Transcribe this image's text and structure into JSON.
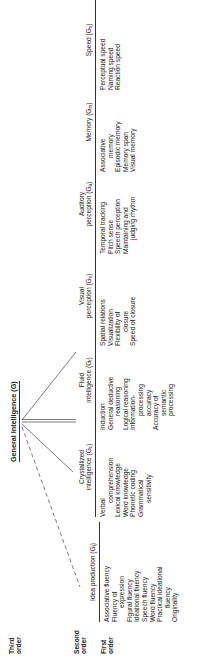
{
  "diagram": {
    "title": "General Intelligence (G)",
    "row_labels": {
      "third": [
        "Third",
        "order"
      ],
      "second": [
        "Second",
        "order"
      ],
      "first": [
        "First",
        "order"
      ]
    },
    "factors": [
      {
        "id": "idea-production",
        "head": [
          "",
          "Idea production (G"
        ],
        "sub": "i",
        "link": "dashed",
        "items": [
          {
            "text": "Associative fluency",
            "indent": false
          },
          {
            "text": "Fluency of",
            "indent": false
          },
          {
            "text": "expression",
            "indent": true
          },
          {
            "text": "Figural fluency",
            "indent": false
          },
          {
            "text": "Ideational fluency",
            "indent": false
          },
          {
            "text": "Speech fluency",
            "indent": false
          },
          {
            "text": "Word fluency",
            "indent": false
          },
          {
            "text": "Practical ideational",
            "indent": false
          },
          {
            "text": "fluency",
            "indent": true
          },
          {
            "text": "Originality",
            "indent": false
          }
        ]
      },
      {
        "id": "crystallized-intelligence",
        "head": [
          "Crystallized",
          "intelligence (G"
        ],
        "sub": "c",
        "link": "solid",
        "items": [
          {
            "text": "Verbal",
            "indent": false
          },
          {
            "text": "comprehension",
            "indent": true
          },
          {
            "text": "Lexical knowledge",
            "indent": false
          },
          {
            "text": "Word knowledge",
            "indent": false
          },
          {
            "text": "Phonetic coding",
            "indent": false
          },
          {
            "text": "Grammatical",
            "indent": false
          },
          {
            "text": "sensitivity",
            "indent": true
          }
        ]
      },
      {
        "id": "fluid-intelligence",
        "head": [
          "Fluid",
          "intelligence (G"
        ],
        "sub": "f",
        "link": "double",
        "items": [
          {
            "text": "Induction",
            "indent": false
          },
          {
            "text": "General deductive",
            "indent": false
          },
          {
            "text": "reasoning",
            "indent": true
          },
          {
            "text": "Logical reasoning",
            "indent": false
          },
          {
            "text": "Information-",
            "indent": false
          },
          {
            "text": "processing",
            "indent": true
          },
          {
            "text": "accuracy",
            "indent": true
          },
          {
            "text": "Accuracy of",
            "indent": false
          },
          {
            "text": "semantic",
            "indent": true
          },
          {
            "text": "processing",
            "indent": true
          }
        ]
      },
      {
        "id": "visual-perception",
        "head": [
          "Visual",
          "perception (G"
        ],
        "sub": "v",
        "link": "solid",
        "items": [
          {
            "text": "Spatial relations",
            "indent": false
          },
          {
            "text": "Visualization",
            "indent": false
          },
          {
            "text": "Flexibility of",
            "indent": false
          },
          {
            "text": "closure",
            "indent": true
          },
          {
            "text": "Speed of closure",
            "indent": false
          }
        ]
      },
      {
        "id": "auditory-perception",
        "head": [
          "Auditory",
          "perception (G"
        ],
        "sub": "a",
        "link": "none",
        "items": [
          {
            "text": "Temporal tracking",
            "indent": false
          },
          {
            "text": "Pitch sense",
            "indent": false
          },
          {
            "text": "Speech perception",
            "indent": false
          },
          {
            "text": "Maintaining and",
            "indent": false
          },
          {
            "text": "judging rhythm",
            "indent": true
          }
        ]
      },
      {
        "id": "memory",
        "head": [
          "",
          "Memory (G"
        ],
        "sub": "m",
        "link": "none",
        "items": [
          {
            "text": "Associative",
            "indent": false
          },
          {
            "text": "memory",
            "indent": true
          },
          {
            "text": "Episodic memory",
            "indent": false
          },
          {
            "text": "Memory span",
            "indent": false
          },
          {
            "text": "Visual memory",
            "indent": false
          }
        ]
      },
      {
        "id": "speed",
        "head": [
          "",
          "Speed (G"
        ],
        "sub": "s",
        "link": "none",
        "items": [
          {
            "text": "Perceptual speed",
            "indent": false
          },
          {
            "text": "Naming speed",
            "indent": false
          },
          {
            "text": "Reaction speed",
            "indent": false
          }
        ]
      }
    ]
  }
}
